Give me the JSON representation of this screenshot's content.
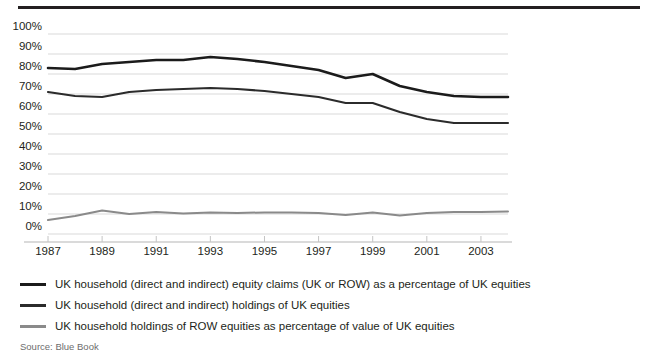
{
  "figure": {
    "source_note": "Source: Blue Book"
  },
  "chart_data": {
    "type": "line",
    "title": "",
    "xlabel": "",
    "ylabel": "",
    "xlim": [
      1987,
      2004
    ],
    "ylim": [
      0,
      100
    ],
    "grid": true,
    "legend_position": "below",
    "y_ticks": [
      "0%",
      "10%",
      "20%",
      "30%",
      "40%",
      "50%",
      "60%",
      "70%",
      "80%",
      "90%",
      "100%"
    ],
    "y_tick_values": [
      0,
      10,
      20,
      30,
      40,
      50,
      60,
      70,
      80,
      90,
      100
    ],
    "x_ticks": [
      "1987",
      "1989",
      "1991",
      "1993",
      "1995",
      "1997",
      "1999",
      "2001",
      "2003"
    ],
    "x_tick_values": [
      1987,
      1989,
      1991,
      1993,
      1995,
      1997,
      1999,
      2001,
      2003
    ],
    "x": [
      1987,
      1988,
      1989,
      1990,
      1991,
      1992,
      1993,
      1994,
      1995,
      1996,
      1997,
      1998,
      1999,
      2000,
      2001,
      2002,
      2003,
      2004
    ],
    "series": [
      {
        "name": "UK household (direct and indirect) equity claims (UK or ROW) as a percentage of UK equities",
        "color": "#1b1b1b",
        "width": 2.6,
        "values": [
          83,
          82.5,
          85,
          86,
          87,
          87,
          88.5,
          87.5,
          86,
          84,
          82,
          78,
          80,
          74,
          71,
          69,
          68.5,
          68.5
        ]
      },
      {
        "name": "UK household (direct and indirect) holdings of UK equities",
        "color": "#2b2b2b",
        "width": 2.1,
        "values": [
          71,
          69,
          68.5,
          71,
          72,
          72.5,
          73,
          72.5,
          71.5,
          70,
          68.5,
          65.5,
          65.5,
          61,
          57.5,
          55.5,
          55.5,
          55.5
        ]
      },
      {
        "name": "UK household holdings of ROW equities as percentage of value of UK equities",
        "color": "#8a8a8a",
        "width": 2.0,
        "values": [
          7,
          9,
          11.8,
          10,
          11,
          10.2,
          10.8,
          10.5,
          10.8,
          10.8,
          10.5,
          9.5,
          10.8,
          9.2,
          10.5,
          11,
          11,
          11.2
        ]
      }
    ]
  },
  "legend": {
    "items": [
      {
        "label": "UK household (direct and indirect) equity claims (UK or ROW) as a percentage of UK equities"
      },
      {
        "label": "UK household (direct and indirect) holdings of UK equities"
      },
      {
        "label": "UK household holdings of ROW equities as percentage of value of UK equities"
      }
    ]
  }
}
